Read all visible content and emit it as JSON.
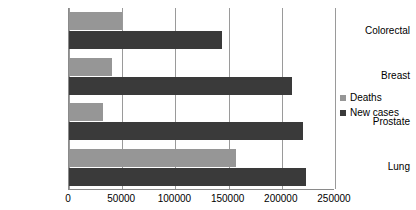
{
  "chart_data": {
    "type": "bar",
    "orientation": "horizontal",
    "title": "",
    "xlabel": "",
    "ylabel": "",
    "categories": [
      "Colorectal",
      "Breast",
      "Prostate",
      "Lung"
    ],
    "series": [
      {
        "name": "Deaths",
        "color": "#969696",
        "values": [
          50000,
          40000,
          32000,
          157000
        ]
      },
      {
        "name": "New cases",
        "color": "#3a3a3a",
        "values": [
          144000,
          210000,
          220000,
          223000
        ]
      }
    ],
    "xlim": [
      0,
      250000
    ],
    "xticks": [
      0,
      50000,
      100000,
      150000,
      200000,
      250000
    ],
    "xtick_labels": [
      "0",
      "50000",
      "100000",
      "150000",
      "200000",
      "250000"
    ],
    "grid": "vertical",
    "legend_position": "right",
    "legend": [
      {
        "label": "Deaths",
        "color": "#969696"
      },
      {
        "label": "New cases",
        "color": "#3a3a3a"
      }
    ]
  }
}
